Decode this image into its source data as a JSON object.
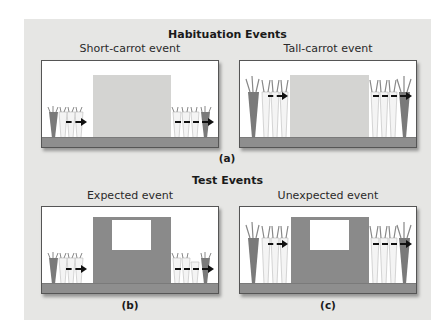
{
  "figure": {
    "habituation": {
      "title": "Habituation Events",
      "left_event_label": "Short-carrot event",
      "right_event_label": "Tall-carrot event",
      "sub_label": "(a)"
    },
    "test": {
      "title": "Test Events",
      "left_event_label": "Expected event",
      "right_event_label": "Unexpected event",
      "left_sub_label": "(b)",
      "right_sub_label": "(c)"
    }
  },
  "colors": {
    "background_panel": "#e6e6e4",
    "ground": "#8e8e8e",
    "screen_light": "#d4d4d2",
    "screen_dark": "#8a8a8a",
    "carrot_dark": "#7a7a7a",
    "carrot_light": "#f4f4f4"
  }
}
